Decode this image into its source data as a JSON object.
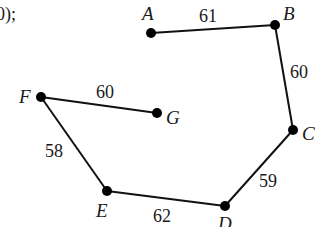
{
  "fragment_text": "0);",
  "graph": {
    "nodes": [
      {
        "id": "A",
        "x": 151,
        "y": 33
      },
      {
        "id": "B",
        "x": 275,
        "y": 25
      },
      {
        "id": "C",
        "x": 293,
        "y": 130
      },
      {
        "id": "D",
        "x": 225,
        "y": 206
      },
      {
        "id": "E",
        "x": 107,
        "y": 191
      },
      {
        "id": "F",
        "x": 41,
        "y": 97
      },
      {
        "id": "G",
        "x": 157,
        "y": 113
      }
    ],
    "edges": [
      {
        "from": "A",
        "to": "B",
        "weight": "61"
      },
      {
        "from": "B",
        "to": "C",
        "weight": "60"
      },
      {
        "from": "C",
        "to": "D",
        "weight": "59"
      },
      {
        "from": "D",
        "to": "E",
        "weight": "62"
      },
      {
        "from": "E",
        "to": "F",
        "weight": "58"
      },
      {
        "from": "F",
        "to": "G",
        "weight": "60"
      }
    ]
  },
  "labels": {
    "A": "A",
    "B": "B",
    "C": "C",
    "D": "D",
    "E": "E",
    "F": "F",
    "G": "G"
  },
  "weights": {
    "AB": "61",
    "BC": "60",
    "CD": "59",
    "DE": "62",
    "EF": "58",
    "FG": "60"
  }
}
